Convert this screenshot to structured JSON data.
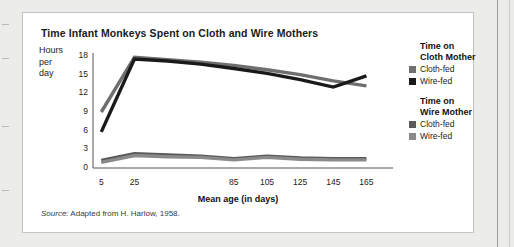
{
  "card": {
    "title": "Time Infant Monkeys Spent on Cloth and Wire Mothers",
    "source_prefix": "Source:",
    "source_text": "Adapted from H. Harlow, 1958."
  },
  "legend": {
    "groups": [
      {
        "heading_line1": "Time on",
        "heading_line2": "Cloth Mother",
        "entries": [
          {
            "label": "Cloth-fed",
            "color": "#6f6f6f"
          },
          {
            "label": "Wire-fed",
            "color": "#1a1a1a"
          }
        ]
      },
      {
        "heading_line1": "Time on",
        "heading_line2": "Wire Mother",
        "entries": [
          {
            "label": "Cloth-fed",
            "color": "#595959"
          },
          {
            "label": "Wire-fed",
            "color": "#8a8a8a"
          }
        ]
      }
    ]
  },
  "chart_data": {
    "type": "line",
    "title": "Time Infant Monkeys Spent on Cloth and Wire Mothers",
    "xlabel": "Mean age (in days)",
    "ylabel": "Hours per day",
    "ylabel_lines": [
      "Hours",
      "per",
      "day"
    ],
    "x": [
      5,
      25,
      45,
      65,
      85,
      105,
      125,
      145,
      165
    ],
    "xlim": [
      0,
      175
    ],
    "ylim": [
      0,
      18
    ],
    "yticks": [
      0,
      3,
      6,
      9,
      12,
      15,
      18
    ],
    "xticks": [
      5,
      25,
      45,
      65,
      85,
      105,
      125,
      145,
      165
    ],
    "xticklabels": [
      "5",
      "25",
      "",
      "",
      "85",
      "105",
      "125",
      "145",
      "165"
    ],
    "grid": false,
    "legend_position": "right",
    "series": [
      {
        "name": "Time on Cloth Mother - Cloth-fed",
        "group": "Time on Cloth Mother",
        "label": "Cloth-fed",
        "color": "#6f6f6f",
        "values": [
          9.0,
          17.8,
          17.4,
          17.0,
          16.5,
          15.8,
          15.0,
          14.0,
          13.2
        ]
      },
      {
        "name": "Time on Cloth Mother - Wire-fed",
        "group": "Time on Cloth Mother",
        "label": "Wire-fed",
        "color": "#1a1a1a",
        "values": [
          5.8,
          17.5,
          17.2,
          16.7,
          16.0,
          15.2,
          14.2,
          13.0,
          14.8
        ]
      },
      {
        "name": "Time on Wire Mother - Cloth-fed",
        "group": "Time on Wire Mother",
        "label": "Cloth-fed",
        "color": "#595959",
        "values": [
          1.2,
          2.3,
          2.1,
          1.9,
          1.5,
          1.9,
          1.6,
          1.5,
          1.5
        ]
      },
      {
        "name": "Time on Wire Mother - Wire-fed",
        "group": "Time on Wire Mother",
        "label": "Wire-fed",
        "color": "#8a8a8a",
        "values": [
          0.9,
          2.0,
          1.8,
          1.7,
          1.3,
          1.7,
          1.4,
          1.3,
          1.3
        ]
      }
    ]
  }
}
